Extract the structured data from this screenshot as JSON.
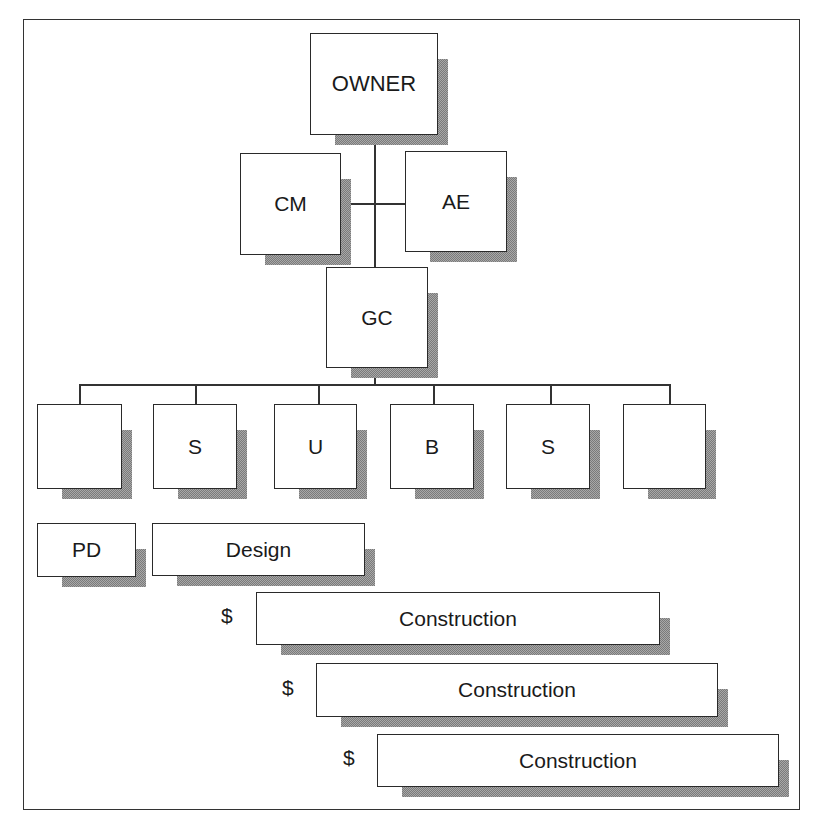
{
  "diagram": {
    "type": "organization-chart",
    "top": {
      "owner": {
        "label": "OWNER"
      },
      "cm": {
        "label": "CM"
      },
      "ae": {
        "label": "AE"
      },
      "gc": {
        "label": "GC"
      }
    },
    "subcontractors": [
      {
        "label": ""
      },
      {
        "label": "S"
      },
      {
        "label": "U"
      },
      {
        "label": "B"
      },
      {
        "label": "S"
      },
      {
        "label": ""
      }
    ],
    "phases": {
      "pd": {
        "label": "PD"
      },
      "design": {
        "label": "Design"
      },
      "construction": [
        {
          "label": "Construction",
          "marker": "$"
        },
        {
          "label": "Construction",
          "marker": "$"
        },
        {
          "label": "Construction",
          "marker": "$"
        }
      ]
    }
  },
  "colors": {
    "border": "#2a2a2a",
    "shadow": "#8c8c8c",
    "background": "#ffffff"
  }
}
